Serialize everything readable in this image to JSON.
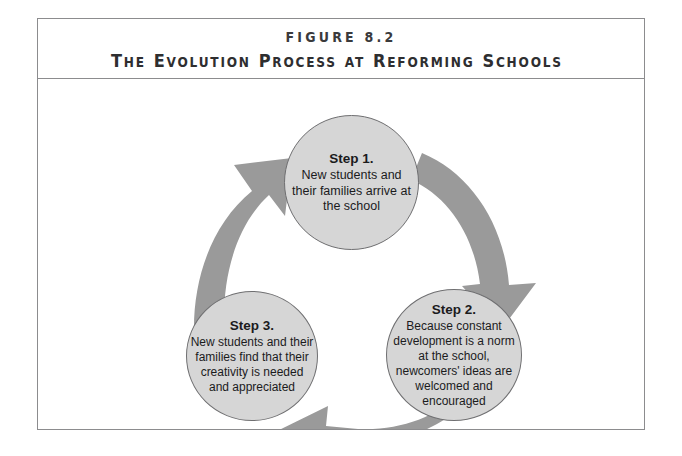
{
  "figure": {
    "label": "FIGURE 8.2",
    "title_words": [
      {
        "cap": "T",
        "rest": "HE"
      },
      {
        "cap": "E",
        "rest": "VOLUTION"
      },
      {
        "cap": "P",
        "rest": "ROCESS"
      },
      {
        "cap": "",
        "rest": "AT"
      },
      {
        "cap": "R",
        "rest": "EFORMING"
      },
      {
        "cap": "S",
        "rest": "CHOOLS"
      }
    ],
    "title_plain": "The Evolution Process at Reforming Schools"
  },
  "colors": {
    "circle_fill": "#d6d6d6",
    "circle_stroke": "#6f6f71",
    "arrow_fill": "#9a9a9a",
    "frame_stroke": "#8c8c8e",
    "text": "#1b1b1d"
  },
  "steps": [
    {
      "id": "step1",
      "heading": "Step 1.",
      "body": "New students and their families arrive at the school"
    },
    {
      "id": "step2",
      "heading": "Step 2.",
      "body": "Because constant development is a norm at the school, newcomers' ideas are welcomed and encouraged"
    },
    {
      "id": "step3",
      "heading": "Step 3.",
      "body": "New students and their families find that their creativity is needed and appreciated"
    }
  ],
  "arrows": [
    {
      "name": "arrow-step1-to-step2",
      "from": "Step 1.",
      "to": "Step 2.",
      "direction": "clockwise-right"
    },
    {
      "name": "arrow-step2-to-step3",
      "from": "Step 2.",
      "to": "Step 3.",
      "direction": "clockwise-bottom-left"
    },
    {
      "name": "arrow-step3-to-step1",
      "from": "Step 3.",
      "to": "Step 1.",
      "direction": "clockwise-up-left"
    }
  ]
}
